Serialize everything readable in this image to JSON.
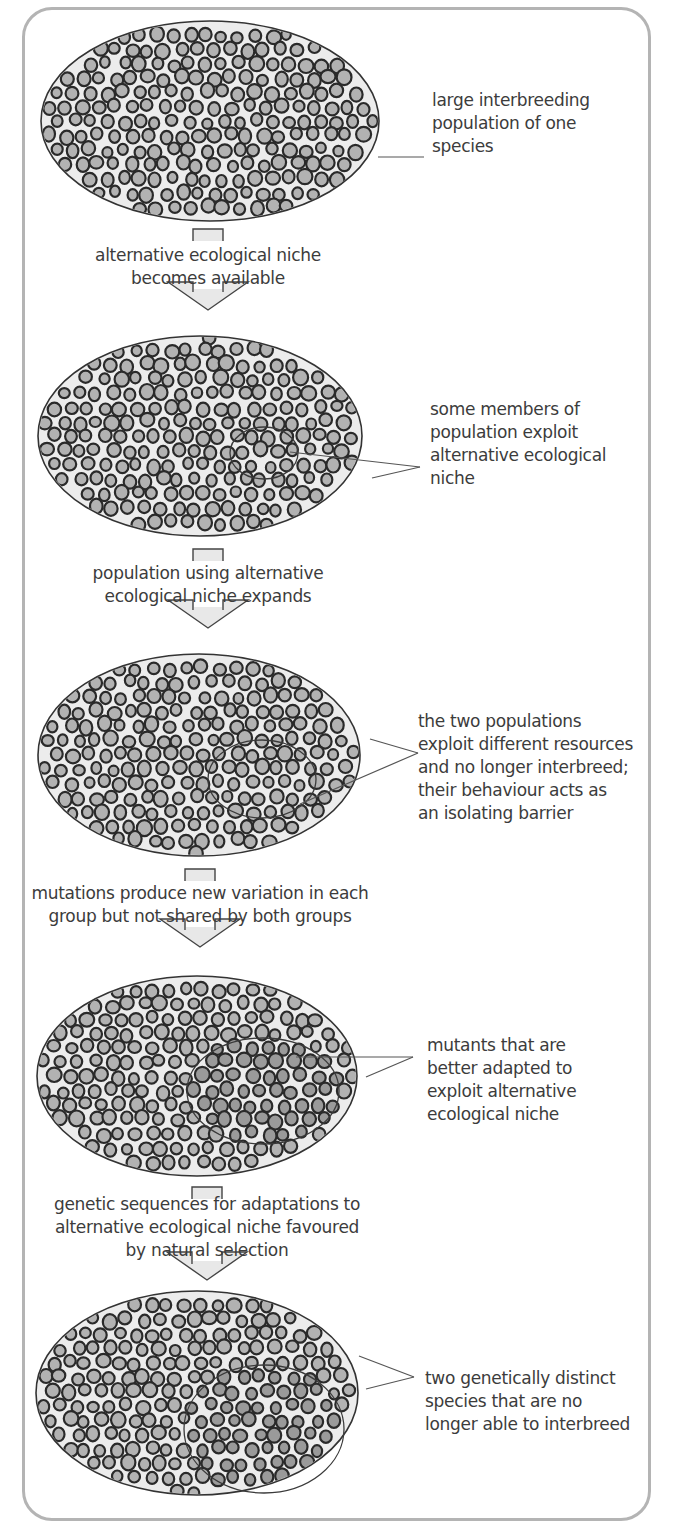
{
  "diagram": {
    "colors": {
      "frame": "#b4b4b4",
      "ellipse_fill": "#ececec",
      "ellipse_stroke": "#333333",
      "cell_fill": "#b2b2b2",
      "cell_fill_inner": "#9a9a9a",
      "cell_stroke": "#2a2a2a",
      "arrow_fill": "#e8e8e8",
      "arrow_stroke": "#444444"
    },
    "panels": [
      {
        "id": "panel-1",
        "ellipse": {
          "cx": 210,
          "cy": 121,
          "rx": 169,
          "ry": 100
        },
        "inner": null,
        "label": {
          "lines": [
            "large interbreeding",
            "population of one",
            "species"
          ],
          "x": 432,
          "y": 89
        },
        "pointer": {
          "from": [
            378,
            157
          ],
          "to": [
            424,
            157
          ],
          "targets": 1
        }
      },
      {
        "id": "panel-2",
        "ellipse": {
          "cx": 200,
          "cy": 436,
          "rx": 162,
          "ry": 100
        },
        "inner": {
          "cx": 264,
          "cy": 453,
          "rx": 34,
          "ry": 26
        },
        "label": {
          "lines": [
            "some members of",
            "population exploit",
            "alternative ecological",
            "niche"
          ],
          "x": 430,
          "y": 398
        },
        "pointer": {
          "to": [
            420,
            467
          ],
          "targets": [
            [
              290,
              452
            ],
            [
              372,
              478
            ]
          ]
        }
      },
      {
        "id": "panel-3",
        "ellipse": {
          "cx": 199,
          "cy": 755,
          "rx": 161,
          "ry": 101
        },
        "inner": {
          "cx": 262,
          "cy": 779,
          "rx": 54,
          "ry": 39
        },
        "label": {
          "lines": [
            "the two populations",
            "exploit different resources",
            "and no longer interbreed;",
            "their behaviour acts as",
            "an isolating barrier"
          ],
          "x": 418,
          "y": 710
        },
        "pointer": {
          "to": [
            418,
            753
          ],
          "targets": [
            [
              370,
              739
            ],
            [
              300,
              804
            ]
          ]
        }
      },
      {
        "id": "panel-4",
        "ellipse": {
          "cx": 197,
          "cy": 1076,
          "rx": 160,
          "ry": 100
        },
        "inner": {
          "cx": 263,
          "cy": 1091,
          "rx": 76,
          "ry": 53
        },
        "label": {
          "lines": [
            "mutants that are",
            "better adapted to",
            "exploit alternative",
            "ecological niche"
          ],
          "x": 427,
          "y": 1034
        },
        "pointer": {
          "to": [
            413,
            1057
          ],
          "targets": [
            [
              296,
              1057
            ],
            [
              366,
              1077
            ]
          ]
        }
      },
      {
        "id": "panel-5",
        "ellipse": {
          "cx": 197,
          "cy": 1393,
          "rx": 161,
          "ry": 102
        },
        "inner": {
          "cx": 264,
          "cy": 1429,
          "rx": 80,
          "ry": 64
        },
        "label": {
          "lines": [
            "two genetically distinct",
            "species that are no",
            "longer able to interbreed"
          ],
          "x": 425,
          "y": 1367
        },
        "pointer": {
          "to": [
            414,
            1377
          ],
          "targets": [
            [
              359,
              1356
            ],
            [
              366,
              1389
            ]
          ]
        }
      }
    ],
    "steps": [
      {
        "id": "step-1",
        "lines": [
          "alternative ecological niche",
          "becomes available"
        ],
        "cx": 208,
        "y": 244,
        "stem_top": 229,
        "arrow_y": 298
      },
      {
        "id": "step-2",
        "lines": [
          "population using alternative",
          "ecological niche expands"
        ],
        "cx": 208,
        "y": 562,
        "stem_top": 549,
        "arrow_y": 616
      },
      {
        "id": "step-3",
        "lines": [
          "mutations produce new variation in each",
          "group but not shared by both groups"
        ],
        "cx": 200,
        "y": 882,
        "stem_top": 869,
        "arrow_y": 935
      },
      {
        "id": "step-4",
        "lines": [
          "genetic sequences for adaptations to",
          "alternative ecological niche favoured",
          "by natural selection"
        ],
        "cx": 207,
        "y": 1193,
        "stem_top": 1187,
        "arrow_y": 1268
      }
    ]
  }
}
